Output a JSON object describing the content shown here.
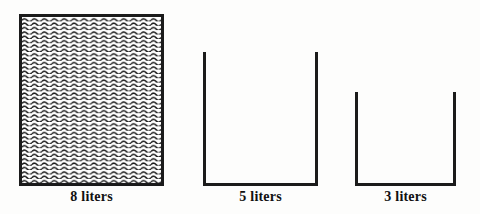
{
  "diagram": {
    "background_color": "#fdfdfc",
    "line_color": "#1b1b1b",
    "fill_pattern": "wavy-hatch",
    "unit": "liters",
    "jugs": [
      {
        "id": "jug-8",
        "capacity": "8",
        "unit_label": "liters",
        "label": "8 liters",
        "state": "full",
        "filled": true,
        "fill_pattern": "wavy-hatch",
        "x": 19,
        "y": 14,
        "width": 145,
        "height": 172
      },
      {
        "id": "jug-5",
        "capacity": "5",
        "unit_label": "liters",
        "label": "5 liters",
        "state": "empty",
        "filled": false,
        "fill_pattern": "none",
        "x": 203,
        "y": 52,
        "width": 115,
        "height": 134
      },
      {
        "id": "jug-3",
        "capacity": "3",
        "unit_label": "liters",
        "label": "3 liters",
        "state": "empty",
        "filled": false,
        "fill_pattern": "none",
        "x": 355,
        "y": 92,
        "width": 101,
        "height": 94
      }
    ]
  }
}
